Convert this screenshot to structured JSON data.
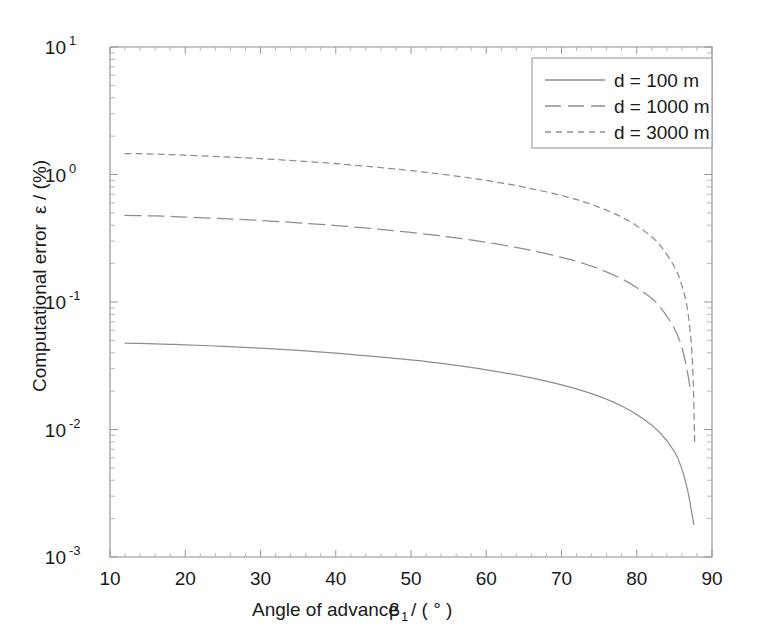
{
  "chart_data": {
    "type": "line",
    "title": "",
    "xlabel": "Angle of advance",
    "xlabel_symbol": "β",
    "xlabel_symbol_sub": "1",
    "xlabel_units": "/ ( ° )",
    "ylabel": "Computational error",
    "ylabel_symbol": "ε",
    "ylabel_units": "/ (%)",
    "xscale": "linear",
    "yscale": "log",
    "xlim": [
      10,
      90
    ],
    "ylim": [
      0.001,
      10
    ],
    "grid": false,
    "legend_position": "upper right",
    "xticks": [
      10,
      20,
      30,
      40,
      50,
      60,
      70,
      80,
      90
    ],
    "xtick_labels": [
      "10",
      "20",
      "30",
      "40",
      "50",
      "60",
      "70",
      "80",
      "90"
    ],
    "yticks": [
      0.001,
      0.01,
      0.1,
      1,
      10
    ],
    "ytick_labels": [
      "10",
      "10",
      "10",
      "10",
      "10"
    ],
    "ytick_exponents": [
      "-3",
      "-2",
      "-1",
      "0",
      "1"
    ],
    "series": [
      {
        "name": "d = 100 m",
        "legend_label": "d = 100 m",
        "linestyle": "solid",
        "color": "#8e8e8e",
        "x": [
          12,
          14,
          16,
          18,
          20,
          25,
          30,
          35,
          40,
          45,
          50,
          55,
          60,
          65,
          70,
          74,
          78,
          81,
          83,
          85,
          86,
          86.8,
          87.3,
          87.6
        ],
        "y": [
          0.0475,
          0.0473,
          0.047,
          0.0466,
          0.0462,
          0.0449,
          0.0434,
          0.0417,
          0.0397,
          0.0375,
          0.0351,
          0.0324,
          0.0294,
          0.0261,
          0.0224,
          0.0191,
          0.0153,
          0.012,
          0.00955,
          0.00672,
          0.00489,
          0.00325,
          0.00222,
          0.0018
        ]
      },
      {
        "name": "d = 1000 m",
        "legend_label": "d = 1000 m",
        "linestyle": "long-dash",
        "color": "#8e8e8e",
        "x": [
          12,
          14,
          16,
          18,
          20,
          25,
          30,
          35,
          40,
          45,
          50,
          55,
          60,
          65,
          70,
          74,
          78,
          81,
          83,
          85,
          86,
          86.7,
          87.2
        ],
        "y": [
          0.478,
          0.476,
          0.473,
          0.469,
          0.464,
          0.451,
          0.436,
          0.418,
          0.398,
          0.376,
          0.351,
          0.324,
          0.294,
          0.261,
          0.224,
          0.191,
          0.152,
          0.118,
          0.093,
          0.062,
          0.044,
          0.029,
          0.0195
        ]
      },
      {
        "name": "d = 3000 m",
        "legend_label": "d = 3000 m",
        "linestyle": "short-dash",
        "color": "#8e8e8e",
        "x": [
          12,
          14,
          16,
          18,
          20,
          25,
          30,
          35,
          40,
          45,
          50,
          55,
          60,
          65,
          70,
          74,
          78,
          81,
          83,
          85,
          86,
          86.8,
          87.4,
          87.7
        ],
        "y": [
          1.46,
          1.455,
          1.445,
          1.432,
          1.418,
          1.378,
          1.331,
          1.277,
          1.216,
          1.148,
          1.073,
          0.99,
          0.899,
          0.797,
          0.684,
          0.582,
          0.464,
          0.36,
          0.283,
          0.189,
          0.134,
          0.083,
          0.034,
          0.008
        ]
      }
    ]
  },
  "legend": {
    "entries": [
      {
        "label": "d = 100 m"
      },
      {
        "label": "d = 1000 m"
      },
      {
        "label": "d = 3000 m"
      }
    ]
  }
}
